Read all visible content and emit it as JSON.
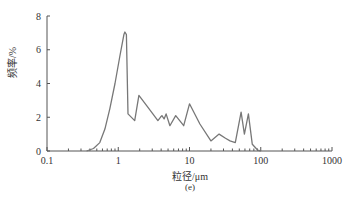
{
  "chart_data": {
    "type": "line",
    "title": "",
    "xlabel": "粒径/μm",
    "ylabel": "频率/%",
    "caption": "(e)",
    "xscale": "log",
    "xlim": [
      0.1,
      1000
    ],
    "ylim": [
      0,
      8
    ],
    "xticks": [
      "0.1",
      "1",
      "10",
      "100",
      "1000"
    ],
    "yticks": [
      "0",
      "2",
      "4",
      "6",
      "8"
    ],
    "grid": false,
    "legend": null,
    "series": [
      {
        "name": "particle size distribution",
        "color": "#777777",
        "x": [
          0.36,
          0.45,
          0.55,
          0.65,
          0.76,
          0.9,
          1.05,
          1.2,
          1.24,
          1.3,
          1.37,
          1.7,
          1.95,
          2.6,
          3.6,
          3.9,
          4.1,
          4.4,
          4.7,
          5.3,
          6.4,
          8.3,
          10.0,
          14.0,
          20.0,
          26.0,
          32.0,
          37.0,
          44.0,
          53.0,
          59.0,
          67.0,
          76.0,
          91.0,
          100.0
        ],
        "y": [
          0.0,
          0.15,
          0.5,
          1.3,
          2.5,
          4.0,
          5.6,
          6.9,
          7.05,
          6.9,
          2.2,
          1.8,
          3.3,
          2.6,
          1.8,
          2.0,
          2.1,
          1.9,
          2.2,
          1.5,
          2.1,
          1.5,
          2.8,
          1.6,
          0.6,
          1.0,
          0.75,
          0.6,
          0.5,
          2.3,
          1.0,
          2.2,
          0.4,
          0.05,
          0.0
        ]
      }
    ]
  },
  "labels": {
    "xlabel": "粒径/μm",
    "ylabel": "频率/%",
    "caption": "(e)"
  }
}
